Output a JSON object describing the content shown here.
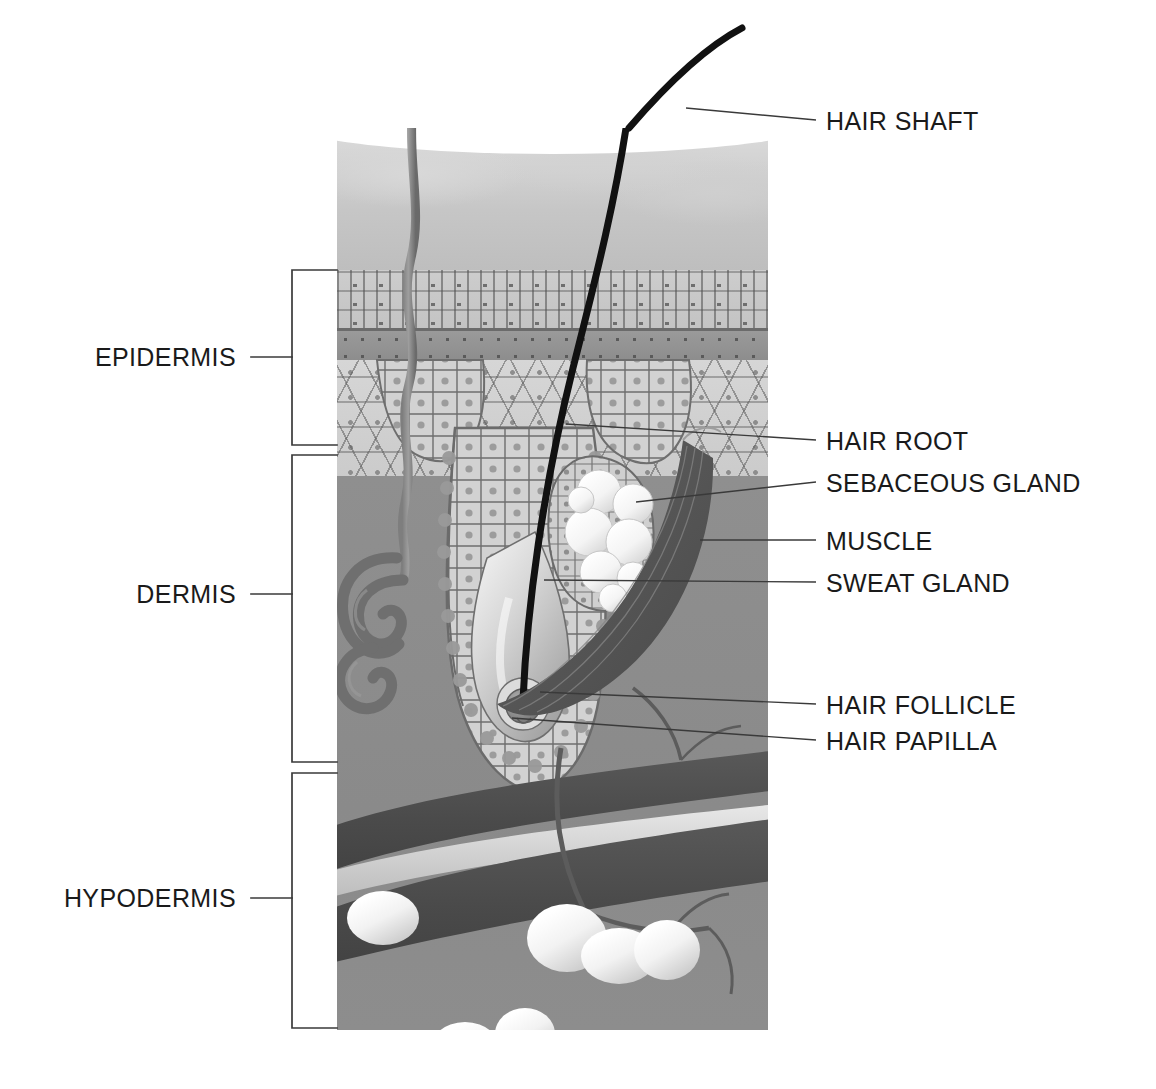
{
  "diagram": {
    "background_color": "#ffffff",
    "tissue_color": "#8e8e8e"
  },
  "layer_labels": [
    {
      "id": "epidermis",
      "text": "EPIDERMIS",
      "side": "left"
    },
    {
      "id": "dermis",
      "text": "DERMIS",
      "side": "left"
    },
    {
      "id": "hypodermis",
      "text": "HYPODERMIS",
      "side": "left"
    }
  ],
  "structure_labels": [
    {
      "id": "hair-shaft",
      "text": "HAIR SHAFT",
      "side": "right"
    },
    {
      "id": "hair-root",
      "text": "HAIR ROOT",
      "side": "right"
    },
    {
      "id": "sebaceous-gland",
      "text": "SEBACEOUS GLAND",
      "side": "right"
    },
    {
      "id": "muscle",
      "text": "MUSCLE",
      "side": "right"
    },
    {
      "id": "sweat-gland",
      "text": "SWEAT GLAND",
      "side": "right"
    },
    {
      "id": "hair-follicle",
      "text": "HAIR FOLLICLE",
      "side": "right"
    },
    {
      "id": "hair-papilla",
      "text": "HAIR PAPILLA",
      "side": "right"
    }
  ],
  "caption": {
    "text": ""
  }
}
